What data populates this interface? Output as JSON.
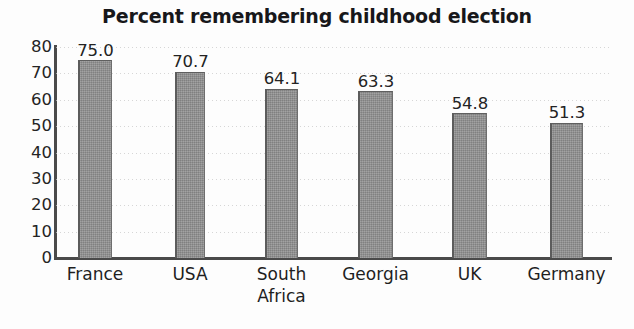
{
  "chart_data": {
    "type": "bar",
    "title": "Percent remembering childhood election",
    "xlabel": "",
    "ylabel": "",
    "categories": [
      "France",
      "USA",
      "South Africa",
      "Georgia",
      "UK",
      "Germany"
    ],
    "category_lines": [
      [
        "France"
      ],
      [
        "USA"
      ],
      [
        "South",
        "Africa"
      ],
      [
        "Georgia"
      ],
      [
        "UK"
      ],
      [
        "Germany"
      ]
    ],
    "values": [
      75.0,
      70.7,
      64.1,
      63.3,
      54.8,
      51.3
    ],
    "value_labels": [
      "75.0",
      "70.7",
      "64.1",
      "63.3",
      "54.8",
      "51.3"
    ],
    "ylim": [
      0,
      80
    ],
    "ytick_values": [
      80,
      70,
      60,
      50,
      40,
      30,
      20,
      10,
      0
    ],
    "ytick_labels": [
      "80",
      "70",
      "60",
      "50",
      "40",
      "30",
      "20",
      "10",
      "0"
    ],
    "grid": true,
    "grid_style": "dotted-horizontal",
    "legend": null,
    "legend_position": "none",
    "colors": {
      "bar_fill": "#8d8d8d",
      "bar_edge": "#5c5c5c",
      "axis": "#4a4a4a",
      "gridline": "#c9c9c9",
      "title_text": "#17171a",
      "tick_text": "#242424",
      "background": "#fdfdfd"
    }
  }
}
